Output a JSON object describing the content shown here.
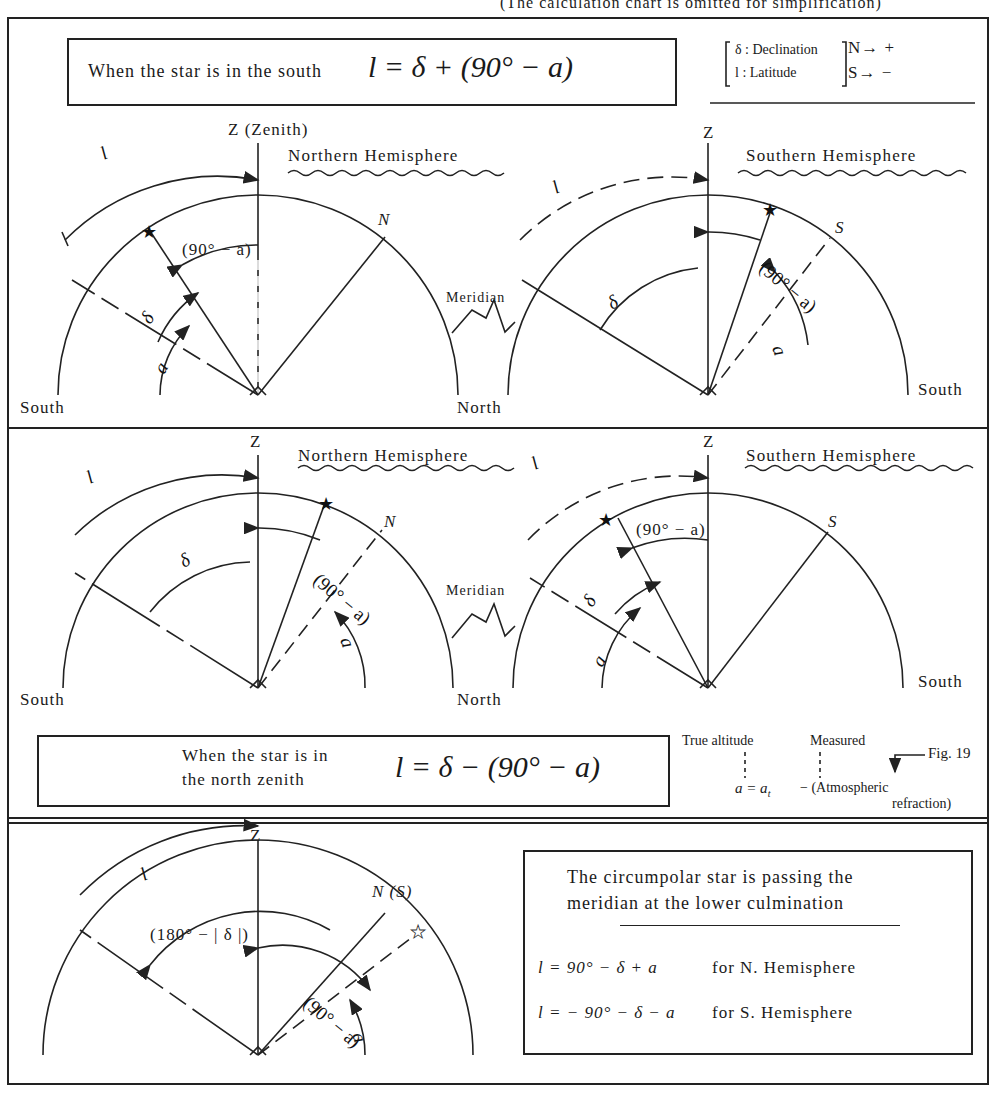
{
  "header_note": "(The calculation chart is omitted for simplification)",
  "legend": {
    "delta_label": "δ : Declination",
    "l_label": "l : Latitude",
    "north_sign": "N→ +",
    "south_sign": "S→ −"
  },
  "section1": {
    "condition_text": "When the star is in the south",
    "formula": "l = δ + (90° − a)",
    "left": {
      "zenith": "Z (Zenith)",
      "hemisphere": "Northern Hemisphere",
      "left_horizon": "South",
      "right_horizon": "North",
      "pole": "N",
      "labels": {
        "l": "l",
        "delta": "δ",
        "a": "a",
        "colat": "(90° − a)"
      }
    },
    "meridian": "Meridian",
    "right": {
      "zenith": "Z",
      "hemisphere": "Southern Hemisphere",
      "right_horizon": "South",
      "pole": "S",
      "labels": {
        "l": "l",
        "delta": "δ",
        "a": "a",
        "colat": "(90° − a)"
      }
    }
  },
  "section2": {
    "left": {
      "zenith": "Z",
      "hemisphere": "Northern Hemisphere",
      "left_horizon": "South",
      "right_horizon": "North",
      "pole": "N",
      "labels": {
        "l": "l",
        "delta": "δ",
        "a": "a",
        "colat": "(90° − a)"
      }
    },
    "meridian": "Meridian",
    "right": {
      "zenith": "Z",
      "hemisphere": "Southern Hemisphere",
      "right_horizon": "South",
      "pole": "S",
      "labels": {
        "l": "l",
        "delta": "δ",
        "a": "a",
        "colat": "(90° − a)"
      }
    },
    "condition_line1": "When the star is in",
    "condition_line2": "the north zenith",
    "formula": "l = δ − (90° − a)",
    "refraction": {
      "true_altitude": "True altitude",
      "measured": "Measured",
      "fig_ref": "Fig. 19",
      "equation_lhs": "a = a",
      "equation_sub": "t",
      "equation_rhs": " − (Atmospheric",
      "equation_tail": "refraction)"
    }
  },
  "section3": {
    "zenith": "Z",
    "pole": "N (S)",
    "labels": {
      "l": "l",
      "supplement": "(180° − | δ |)",
      "colat": "(90° − a)",
      "a": "a"
    },
    "box_line1": "The circumpolar star is passing the",
    "box_line2": "meridian at the lower culmination",
    "formula_north": "l = 90° − δ + a",
    "formula_north_note": "for N. Hemisphere",
    "formula_south": "l = − 90° − δ − a",
    "formula_south_note": "for S. Hemisphere"
  },
  "icons": {
    "filled_star": "★",
    "hollow_star": "☆"
  }
}
